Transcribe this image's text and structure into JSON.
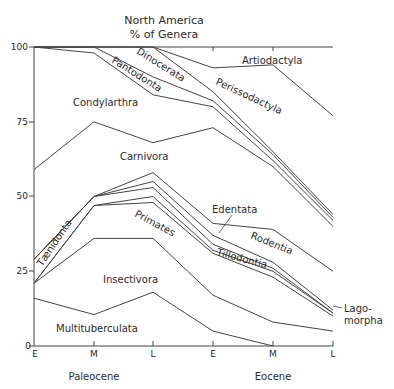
{
  "chart_data": {
    "type": "area",
    "title": "North America",
    "subtitle": "% of Genera",
    "xlabel": "",
    "ylabel": "% of Genera",
    "ylim": [
      0,
      100
    ],
    "y_ticks": [
      "0",
      "25",
      "50",
      "75",
      "100"
    ],
    "x_ticks": [
      "E",
      "M",
      "L",
      "E",
      "M",
      "L"
    ],
    "epochs": [
      {
        "label": "Paleocene",
        "ticks": [
          "E",
          "M",
          "L"
        ]
      },
      {
        "label": "Eocene",
        "ticks": [
          "E",
          "M",
          "L"
        ]
      }
    ],
    "note": "Stacked boundaries: each line is the cumulative upper edge (%) of the group, from bottom to top.",
    "boundaries": [
      {
        "name": "Multituberculata",
        "values": [
          16,
          10.5,
          18,
          5,
          0,
          null
        ]
      },
      {
        "name": "Insectivora",
        "values": [
          21,
          36,
          36,
          17,
          8,
          5
        ]
      },
      {
        "name": "Primates",
        "values": [
          21,
          47,
          48,
          31,
          23,
          10
        ]
      },
      {
        "name": "Tillodontia",
        "values": [
          21,
          47,
          50,
          32,
          25,
          11
        ]
      },
      {
        "name": "Taeniodonta",
        "values": [
          29,
          50,
          53,
          34,
          26,
          11
        ]
      },
      {
        "name": "Rodentia",
        "values": [
          29,
          50,
          55,
          37,
          28,
          12
        ]
      },
      {
        "name": "Edentata",
        "values": [
          29,
          50,
          58,
          41,
          39,
          25
        ]
      },
      {
        "name": "Carnivora",
        "values": [
          59,
          75,
          68,
          73,
          60,
          40
        ]
      },
      {
        "name": "Condylarthra",
        "values": [
          100,
          98,
          84,
          80,
          62,
          42
        ]
      },
      {
        "name": "Pantodonta",
        "values": [
          100,
          100,
          90,
          82,
          64,
          43
        ]
      },
      {
        "name": "Dinocerata",
        "values": [
          100,
          100,
          100,
          85,
          65,
          44
        ]
      },
      {
        "name": "Perissodactyla",
        "values": [
          100,
          100,
          100,
          93,
          94,
          77
        ]
      },
      {
        "name": "Artiodactyla",
        "values": [
          100,
          100,
          100,
          100,
          100,
          100
        ]
      }
    ],
    "labels": [
      {
        "text": "Artiodactyla",
        "region": "top-right"
      },
      {
        "text": "Perissodactyla",
        "region": "upper-middle-right"
      },
      {
        "text": "Dinocerata",
        "region": "upper-middle"
      },
      {
        "text": "Pantodonta",
        "region": "upper-left-middle"
      },
      {
        "text": "Condylarthra",
        "region": "upper-left"
      },
      {
        "text": "Carnivora",
        "region": "middle"
      },
      {
        "text": "Edentata",
        "region": "middle-right"
      },
      {
        "text": "Rodentia",
        "region": "middle-right"
      },
      {
        "text": "Tillodontia",
        "region": "middle-right"
      },
      {
        "text": "Taeniodonta",
        "region": "left-middle"
      },
      {
        "text": "Primates",
        "region": "middle"
      },
      {
        "text": "Insectivora",
        "region": "lower-middle"
      },
      {
        "text": "Multituberculata",
        "region": "bottom"
      },
      {
        "text": "Lago-morpha",
        "region": "right-margin"
      }
    ]
  },
  "text": {
    "title_line1": "North   America",
    "title_line2": "%   of   Genera",
    "y100": "100",
    "y75": "75",
    "y50": "50",
    "y25": "25",
    "y0": "0",
    "xE1": "E",
    "xM1": "M",
    "xL1": "L",
    "xE2": "E",
    "xM2": "M",
    "xL2": "L",
    "paleocene": "Paleocene",
    "eocene": "Eocene",
    "artiodactyla": "Artiodactyla",
    "perissodactyla": "Perissodactyla",
    "dinocerata": "Dinocerata",
    "pantodonta": "Pantodonta",
    "condylarthra": "Condylarthra",
    "carnivora": "Carnivora",
    "edentata": "Edentata",
    "rodentia": "Rodentia",
    "tillodontia": "Tillodontia",
    "taeniodonta": "Tænidonta",
    "primates": "Primates",
    "insectivora": "Insectivora",
    "multituberculata": "Multituberculata",
    "lago1": "Lago-",
    "lago2": "morpha"
  }
}
